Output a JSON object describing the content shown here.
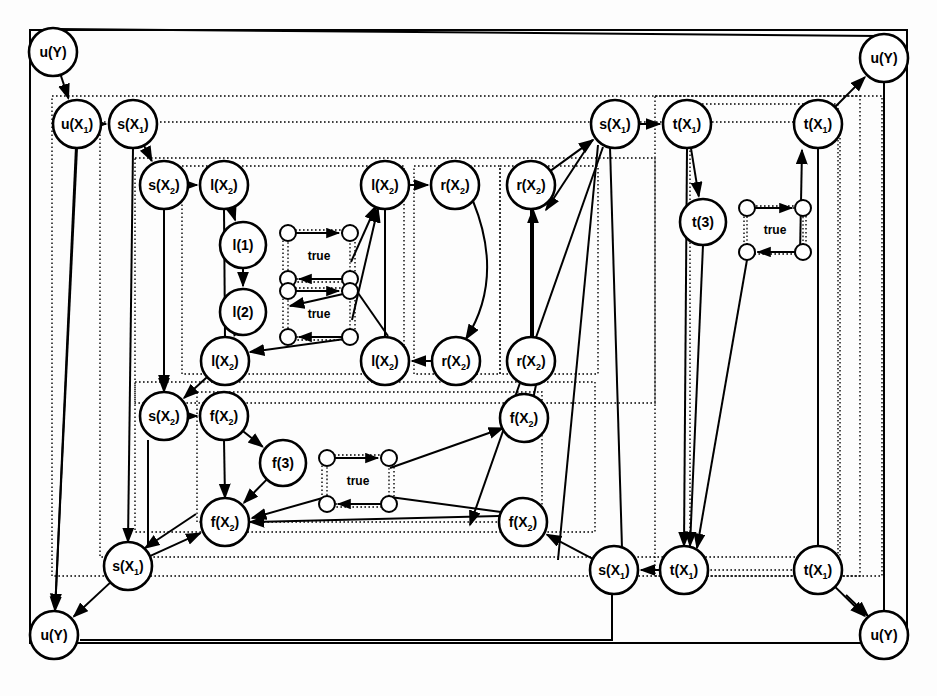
{
  "figure": {
    "type": "predicate-dependency-graph",
    "background": "#fdfdfd",
    "stroke": "#000000",
    "fill": "#ffffff",
    "width": 937,
    "height": 696
  },
  "frames": [
    {
      "name": "outer-frame",
      "x": 30,
      "y": 30,
      "w": 877,
      "h": 613,
      "style": "solid"
    },
    {
      "name": "u-scope-frame",
      "x": 52,
      "y": 96,
      "w": 830,
      "h": 480,
      "style": "dotted"
    },
    {
      "name": "body-frame",
      "x": 100,
      "y": 122,
      "w": 740,
      "h": 435,
      "style": "dotted"
    },
    {
      "name": "lr-scope-frame",
      "x": 135,
      "y": 158,
      "w": 520,
      "h": 245,
      "style": "dotted"
    },
    {
      "name": "l-group-frame",
      "x": 182,
      "y": 166,
      "w": 222,
      "h": 208,
      "style": "dotted"
    },
    {
      "name": "l-true-frame-upper",
      "x": 283,
      "y": 230,
      "w": 72,
      "h": 52,
      "style": "dotted"
    },
    {
      "name": "l-true-frame-lower",
      "x": 283,
      "y": 288,
      "w": 72,
      "h": 52,
      "style": "dotted"
    },
    {
      "name": "r-group-frame",
      "x": 414,
      "y": 166,
      "w": 86,
      "h": 208,
      "style": "dotted"
    },
    {
      "name": "r-outer-frame",
      "x": 500,
      "y": 166,
      "w": 98,
      "h": 208,
      "style": "dotted"
    },
    {
      "name": "f-scope-frame",
      "x": 135,
      "y": 382,
      "w": 460,
      "h": 150,
      "style": "dotted"
    },
    {
      "name": "f-group-frame",
      "x": 197,
      "y": 392,
      "w": 345,
      "h": 130,
      "style": "dotted"
    },
    {
      "name": "f-true-frame",
      "x": 322,
      "y": 455,
      "w": 72,
      "h": 52,
      "style": "dotted"
    },
    {
      "name": "t-scope-frame",
      "x": 655,
      "y": 96,
      "w": 205,
      "h": 480,
      "style": "dotted"
    },
    {
      "name": "t-group-frame",
      "x": 690,
      "y": 104,
      "w": 148,
      "h": 466,
      "style": "dotted"
    },
    {
      "name": "t-true-frame",
      "x": 744,
      "y": 206,
      "w": 62,
      "h": 48,
      "style": "dotted"
    }
  ],
  "nodes": [
    {
      "id": "uY_tl",
      "name": "node-u-Y-top-left",
      "label": "u(Y)",
      "base": "u",
      "sub": "",
      "arg": "Y",
      "x": 53,
      "y": 52,
      "r": 24
    },
    {
      "id": "uY_tr",
      "name": "node-u-Y-top-right",
      "label": "u(Y)",
      "base": "u",
      "sub": "",
      "arg": "Y",
      "x": 884,
      "y": 58,
      "r": 24
    },
    {
      "id": "uY_bl",
      "name": "node-u-Y-bottom-left",
      "label": "u(Y)",
      "base": "u",
      "sub": "",
      "arg": "Y",
      "x": 54,
      "y": 635,
      "r": 24
    },
    {
      "id": "uY_br",
      "name": "node-u-Y-bottom-right",
      "label": "u(Y)",
      "base": "u",
      "sub": "",
      "arg": "Y",
      "x": 884,
      "y": 635,
      "r": 24
    },
    {
      "id": "uX1",
      "name": "node-u-X1",
      "label": "u(X",
      "base": "u",
      "sub": "1",
      "arg": "X",
      "x": 77,
      "y": 124,
      "r": 24
    },
    {
      "id": "sX1_t",
      "name": "node-s-X1-top-left",
      "label": "s(X",
      "base": "s",
      "sub": "1",
      "arg": "X",
      "x": 133,
      "y": 124,
      "r": 24
    },
    {
      "id": "sX2_t",
      "name": "node-s-X2-upper-left",
      "label": "s(X",
      "base": "s",
      "sub": "2",
      "arg": "X",
      "x": 164,
      "y": 185,
      "r": 24
    },
    {
      "id": "lX2_tl",
      "name": "node-l-X2-top-left",
      "label": "l(X",
      "base": "l",
      "sub": "2",
      "arg": "X",
      "x": 224,
      "y": 185,
      "r": 24
    },
    {
      "id": "l1",
      "name": "node-l-1",
      "label": "l(1)",
      "base": "l",
      "sub": "",
      "arg": "1",
      "x": 243,
      "y": 245,
      "r": 23
    },
    {
      "id": "l2",
      "name": "node-l-2",
      "label": "l(2)",
      "base": "l",
      "sub": "",
      "arg": "2",
      "x": 243,
      "y": 312,
      "r": 23
    },
    {
      "id": "lX2_bl",
      "name": "node-l-X2-bottom-left",
      "label": "l(X",
      "base": "l",
      "sub": "2",
      "arg": "X",
      "x": 225,
      "y": 361,
      "r": 24
    },
    {
      "id": "lX2_tr",
      "name": "node-l-X2-top-right",
      "label": "l(X",
      "base": "l",
      "sub": "2",
      "arg": "X",
      "x": 385,
      "y": 185,
      "r": 24
    },
    {
      "id": "lX2_br",
      "name": "node-l-X2-bottom-right",
      "label": "l(X",
      "base": "l",
      "sub": "2",
      "arg": "X",
      "x": 385,
      "y": 361,
      "r": 24
    },
    {
      "id": "rX2_tl",
      "name": "node-r-X2-top-left",
      "label": "r(X",
      "base": "r",
      "sub": "2",
      "arg": "X",
      "x": 455,
      "y": 185,
      "r": 24
    },
    {
      "id": "rX2_bl",
      "name": "node-r-X2-bottom-left",
      "label": "r(X",
      "base": "r",
      "sub": "2",
      "arg": "X",
      "x": 456,
      "y": 361,
      "r": 24
    },
    {
      "id": "rX2_tr",
      "name": "node-r-X2-top-right",
      "label": "r(X",
      "base": "r",
      "sub": "2",
      "arg": "X",
      "x": 531,
      "y": 185,
      "r": 24
    },
    {
      "id": "rX2_br",
      "name": "node-r-X2-bottom-right",
      "label": "r(X",
      "base": "r",
      "sub": "2",
      "arg": "X",
      "x": 531,
      "y": 361,
      "r": 24
    },
    {
      "id": "sX1_r",
      "name": "node-s-X1-top-right",
      "label": "s(X",
      "base": "s",
      "sub": "1",
      "arg": "X",
      "x": 615,
      "y": 124,
      "r": 24
    },
    {
      "id": "tX1_l",
      "name": "node-t-X1-top-left",
      "label": "t(X",
      "base": "t",
      "sub": "1",
      "arg": "X",
      "x": 687,
      "y": 124,
      "r": 24
    },
    {
      "id": "tX1_r",
      "name": "node-t-X1-top-right",
      "label": "t(X",
      "base": "t",
      "sub": "1",
      "arg": "X",
      "x": 818,
      "y": 124,
      "r": 24
    },
    {
      "id": "t3",
      "name": "node-t-3",
      "label": "t(3)",
      "base": "t",
      "sub": "",
      "arg": "3",
      "x": 703,
      "y": 222,
      "r": 23
    },
    {
      "id": "sX2_b",
      "name": "node-s-X2-lower-left",
      "label": "s(X",
      "base": "s",
      "sub": "2",
      "arg": "X",
      "x": 164,
      "y": 416,
      "r": 24
    },
    {
      "id": "fX2_tl",
      "name": "node-f-X2-top-left",
      "label": "f(X",
      "base": "f",
      "sub": "2",
      "arg": "X",
      "x": 224,
      "y": 416,
      "r": 24
    },
    {
      "id": "f3",
      "name": "node-f-3",
      "label": "f(3)",
      "base": "f",
      "sub": "",
      "arg": "3",
      "x": 283,
      "y": 463,
      "r": 23
    },
    {
      "id": "fX2_bl",
      "name": "node-f-X2-bottom-left",
      "label": "f(X",
      "base": "f",
      "sub": "2",
      "arg": "X",
      "x": 225,
      "y": 522,
      "r": 24
    },
    {
      "id": "fX2_tr",
      "name": "node-f-X2-top-right",
      "label": "f(X",
      "base": "f",
      "sub": "2",
      "arg": "X",
      "x": 524,
      "y": 418,
      "r": 24
    },
    {
      "id": "fX2_br",
      "name": "node-f-X2-bottom-right",
      "label": "f(X",
      "base": "f",
      "sub": "2",
      "arg": "X",
      "x": 523,
      "y": 522,
      "r": 24
    },
    {
      "id": "sX1_bl",
      "name": "node-s-X1-bottom-left",
      "label": "s(X",
      "base": "s",
      "sub": "1",
      "arg": "X",
      "x": 128,
      "y": 566,
      "r": 24
    },
    {
      "id": "sX1_brt",
      "name": "node-s-X1-bottom-right",
      "label": "s(X",
      "base": "s",
      "sub": "1",
      "arg": "X",
      "x": 614,
      "y": 570,
      "r": 24
    },
    {
      "id": "tX1_bl",
      "name": "node-t-X1-bottom-left",
      "label": "t(X",
      "base": "t",
      "sub": "1",
      "arg": "X",
      "x": 684,
      "y": 570,
      "r": 24
    },
    {
      "id": "tX1_br",
      "name": "node-t-X1-bottom-right",
      "label": "t(X",
      "base": "t",
      "sub": "1",
      "arg": "X",
      "x": 818,
      "y": 570,
      "r": 24
    }
  ],
  "true_boxes": [
    {
      "id": "tb_l1",
      "name": "true-box-l-upper",
      "label": "true",
      "cx": 319,
      "cy": 256,
      "w": 62,
      "h": 46
    },
    {
      "id": "tb_l2",
      "name": "true-box-l-lower",
      "label": "true",
      "cx": 319,
      "cy": 314,
      "w": 62,
      "h": 46
    },
    {
      "id": "tb_t",
      "name": "true-box-t",
      "label": "true",
      "cx": 775,
      "cy": 230,
      "w": 56,
      "h": 44
    },
    {
      "id": "tb_f",
      "name": "true-box-f",
      "label": "true",
      "cx": 358,
      "cy": 481,
      "w": 62,
      "h": 46
    }
  ],
  "small_node_radius": 8,
  "edges": [
    {
      "from": "uY_tl",
      "to": "uX1",
      "name": "edge-uY-to-uX1"
    },
    {
      "from": "uX1",
      "to": "sX1_t",
      "name": "edge-uX1-to-sX1"
    },
    {
      "from": "sX1_t",
      "to": "sX2_t",
      "name": "edge-sX1-to-sX2"
    },
    {
      "from": "sX2_t",
      "to": "lX2_tl",
      "name": "edge-sX2-to-lX2"
    },
    {
      "from": "lX2_tl",
      "to": "l1",
      "name": "edge-lX2-to-l1"
    },
    {
      "from": "l1",
      "to": "l2",
      "name": "edge-l1-to-l2"
    },
    {
      "from": "l2",
      "to": "lX2_bl",
      "name": "edge-l2-to-lX2bl"
    },
    {
      "from": "lX2_tr",
      "to": "rX2_tl",
      "name": "edge-lX2tr-to-rX2tl"
    },
    {
      "from": "rX2_bl",
      "to": "lX2_br",
      "name": "edge-rX2bl-to-lX2br"
    },
    {
      "from": "rX2_tl",
      "to": "rX2_bl",
      "name": "edge-rX2tl-to-rX2bl"
    },
    {
      "from": "rX2_br",
      "to": "rX2_tr",
      "name": "edge-rX2br-to-rX2tr"
    },
    {
      "from": "rX2_tr",
      "to": "sX1_r",
      "name": "edge-rX2tr-to-sX1r"
    },
    {
      "from": "sX1_r",
      "to": "tX1_l",
      "name": "edge-sX1r-to-tX1l"
    },
    {
      "from": "tX1_l",
      "to": "t3",
      "name": "edge-tX1l-to-t3"
    },
    {
      "from": "tX1_r",
      "to": "uY_tr",
      "name": "edge-tX1r-to-uYtr"
    },
    {
      "from": "sX2_b",
      "to": "fX2_tl",
      "name": "edge-sX2b-to-fX2tl"
    },
    {
      "from": "fX2_tl",
      "to": "f3",
      "name": "edge-fX2tl-to-f3"
    },
    {
      "from": "f3",
      "to": "fX2_bl",
      "name": "edge-f3-to-fX2bl"
    },
    {
      "from": "sX1_bl",
      "to": "fX2_bl",
      "name": "edge-sX1bl-to-fX2bl"
    },
    {
      "from": "sX1_bl",
      "to": "uY_bl",
      "name": "edge-sX1bl-to-uYbl"
    },
    {
      "from": "tX1_bl",
      "to": "sX1_brt",
      "name": "edge-tX1bl-to-sX1brt"
    },
    {
      "from": "tX1_br",
      "to": "uY_br",
      "name": "edge-tX1br-to-uYbr"
    },
    {
      "from": "sX1_brt",
      "to": "fX2_br",
      "name": "edge-sX1brt-to-fX2br"
    },
    {
      "from": "lX2_bl",
      "to": "sX2_b",
      "name": "edge-lX2bl-to-sX2b"
    },
    {
      "from": "sX2_t",
      "to": "sX2_b",
      "name": "edge-sX2t-to-sX2b"
    },
    {
      "from": "uX1",
      "to": "uY_bl",
      "name": "edge-uX1-to-uYbl"
    },
    {
      "from": "uY_tl",
      "to": "uY_tr",
      "name": "edge-uYtl-to-uYtr"
    }
  ],
  "caption": ""
}
